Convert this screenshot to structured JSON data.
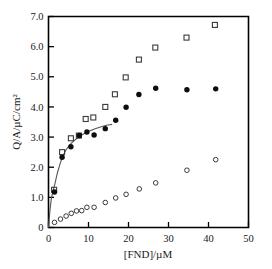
{
  "chart_data": {
    "type": "scatter",
    "title": "",
    "xlabel": "[FND]/µM",
    "ylabel": "Q/A/µC/cm²",
    "xlim": [
      0,
      50
    ],
    "ylim": [
      0,
      7.0
    ],
    "xticks": [
      0,
      10,
      20,
      30,
      40,
      50
    ],
    "yticks": [
      "0",
      "1.0",
      "2.0",
      "3.0",
      "4.0",
      "5.0",
      "6.0",
      "7.0"
    ],
    "ytick_values": [
      0,
      1.0,
      2.0,
      3.0,
      4.0,
      5.0,
      6.0,
      7.0
    ],
    "xtick_labels": [
      "0",
      "10",
      "20",
      "30",
      "40",
      "50"
    ],
    "grid": false,
    "legend": "none",
    "series": [
      {
        "name": "open-square-series",
        "marker": "open-square",
        "color": "#3a3a3a",
        "points": [
          [
            1.4,
            1.25
          ],
          [
            3.4,
            2.5
          ],
          [
            5.6,
            2.96
          ],
          [
            7.6,
            3.05
          ],
          [
            9.3,
            3.6
          ],
          [
            11.2,
            3.65
          ],
          [
            14.2,
            4.0
          ],
          [
            16.6,
            4.42
          ],
          [
            19.3,
            4.98
          ],
          [
            22.6,
            5.57
          ],
          [
            26.7,
            5.97
          ],
          [
            34.5,
            6.3
          ],
          [
            41.6,
            6.72
          ]
        ]
      },
      {
        "name": "filled-circle-series",
        "marker": "filled-circle",
        "color": "#0d0d0d",
        "points": [
          [
            1.5,
            1.18
          ],
          [
            3.4,
            2.33
          ],
          [
            5.6,
            2.68
          ],
          [
            7.7,
            3.05
          ],
          [
            9.6,
            3.17
          ],
          [
            11.4,
            3.07
          ],
          [
            14.2,
            3.28
          ],
          [
            16.8,
            3.56
          ],
          [
            19.4,
            3.99
          ],
          [
            22.6,
            4.41
          ],
          [
            26.8,
            4.62
          ],
          [
            34.6,
            4.57
          ],
          [
            41.8,
            4.6
          ]
        ]
      },
      {
        "name": "open-circle-series",
        "marker": "open-circle",
        "color": "#3a3a3a",
        "points": [
          [
            1.5,
            0.17
          ],
          [
            3.0,
            0.28
          ],
          [
            4.4,
            0.38
          ],
          [
            5.7,
            0.47
          ],
          [
            7.0,
            0.55
          ],
          [
            8.3,
            0.56
          ],
          [
            9.6,
            0.67
          ],
          [
            11.4,
            0.67
          ],
          [
            14.2,
            0.83
          ],
          [
            16.8,
            0.98
          ],
          [
            19.4,
            1.1
          ],
          [
            22.7,
            1.28
          ],
          [
            26.8,
            1.48
          ],
          [
            34.6,
            1.9
          ],
          [
            41.8,
            2.25
          ]
        ]
      }
    ],
    "fit_curve": {
      "name": "langmuir-fit-curve",
      "color": "#555555",
      "points": [
        [
          0.0,
          0.0
        ],
        [
          0.35,
          0.55
        ],
        [
          0.7,
          0.95
        ],
        [
          1.1,
          1.2
        ],
        [
          1.6,
          1.45
        ],
        [
          2.2,
          1.8
        ],
        [
          2.9,
          2.12
        ],
        [
          3.6,
          2.38
        ],
        [
          4.4,
          2.58
        ],
        [
          5.3,
          2.74
        ],
        [
          6.2,
          2.86
        ],
        [
          7.2,
          2.97
        ],
        [
          8.2,
          3.06
        ],
        [
          9.3,
          3.14
        ],
        [
          10.4,
          3.21
        ],
        [
          11.5,
          3.27
        ],
        [
          12.6,
          3.32
        ],
        [
          13.6,
          3.36
        ],
        [
          14.5,
          3.39
        ],
        [
          15.3,
          3.41
        ],
        [
          15.9,
          3.42
        ]
      ]
    }
  }
}
